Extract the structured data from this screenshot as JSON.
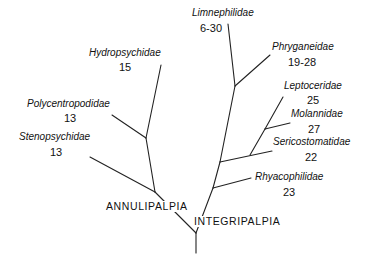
{
  "diagram": {
    "type": "phylogenetic-tree",
    "line_color": "#222222",
    "groups": [
      {
        "id": "annulipalpia",
        "label": "ANNULIPALPIA"
      },
      {
        "id": "integripalpia",
        "label": "INTEGRIPALPIA"
      }
    ],
    "taxa": [
      {
        "id": "hydropsychidae",
        "name": "Hydropsychidae",
        "value": "15",
        "group": "annulipalpia"
      },
      {
        "id": "polycentropodidae",
        "name": "Polycentropodidae",
        "value": "13",
        "group": "annulipalpia"
      },
      {
        "id": "stenopsychidae",
        "name": "Stenopsychidae",
        "value": "13",
        "group": "annulipalpia"
      },
      {
        "id": "limnephilidae",
        "name": "Limnephilidae",
        "value": "6-30",
        "group": "integripalpia"
      },
      {
        "id": "phryganeidae",
        "name": "Phryganeidae",
        "value": "19-28",
        "group": "integripalpia"
      },
      {
        "id": "leptoceridae",
        "name": "Leptoceridae",
        "value": "25",
        "group": "integripalpia"
      },
      {
        "id": "molannidae",
        "name": "Molannidae",
        "value": "27",
        "group": "integripalpia"
      },
      {
        "id": "sericostomatidae",
        "name": "Sericostomatidae",
        "value": "22",
        "group": "integripalpia"
      },
      {
        "id": "rhyacophilidae",
        "name": "Rhyacophilidae",
        "value": "23",
        "group": "integripalpia"
      }
    ]
  }
}
